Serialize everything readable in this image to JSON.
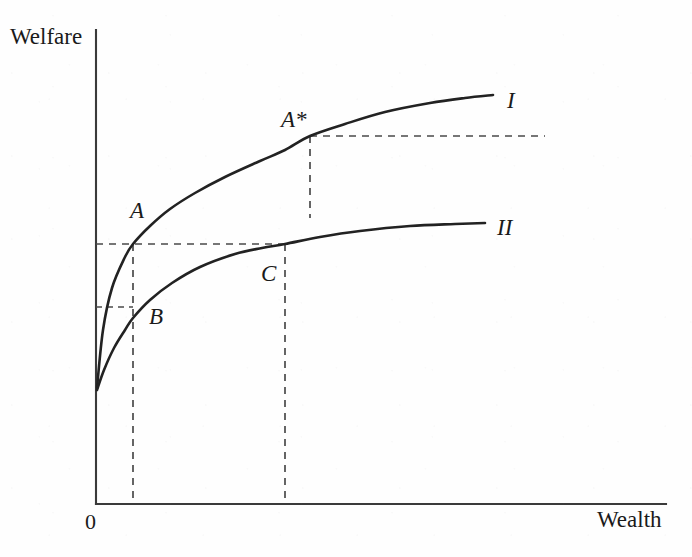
{
  "chart_data": {
    "type": "line",
    "title": "",
    "xlabel": "Wealth",
    "ylabel": "Welfare",
    "grid": false,
    "legend": "inline-right-of-curve",
    "axis_origin_label": "0",
    "axes": {
      "x_axis_pixel_y": 504,
      "y_axis_pixel_x": 96,
      "x_range_shown": [
        0,
        1
      ],
      "y_range_shown": [
        0,
        1
      ]
    },
    "series": [
      {
        "name": "I",
        "label": "I",
        "label_point": {
          "x": 510,
          "y": 101
        },
        "style": "solid",
        "color": "#222222",
        "points": [
          {
            "x": 97,
            "y": 388
          },
          {
            "x": 103,
            "y": 330
          },
          {
            "x": 112,
            "y": 288
          },
          {
            "x": 125,
            "y": 257
          },
          {
            "x": 133,
            "y": 244
          },
          {
            "x": 150,
            "y": 226
          },
          {
            "x": 170,
            "y": 209
          },
          {
            "x": 195,
            "y": 193
          },
          {
            "x": 225,
            "y": 177
          },
          {
            "x": 260,
            "y": 161
          },
          {
            "x": 285,
            "y": 150
          },
          {
            "x": 310,
            "y": 136
          },
          {
            "x": 345,
            "y": 124
          },
          {
            "x": 385,
            "y": 112
          },
          {
            "x": 430,
            "y": 103
          },
          {
            "x": 465,
            "y": 98
          },
          {
            "x": 493,
            "y": 95
          }
        ]
      },
      {
        "name": "II",
        "label": "II",
        "label_point": {
          "x": 500,
          "y": 229
        },
        "style": "solid",
        "color": "#222222",
        "points": [
          {
            "x": 97,
            "y": 390
          },
          {
            "x": 104,
            "y": 370
          },
          {
            "x": 114,
            "y": 348
          },
          {
            "x": 125,
            "y": 330
          },
          {
            "x": 133,
            "y": 318
          },
          {
            "x": 150,
            "y": 300
          },
          {
            "x": 172,
            "y": 283
          },
          {
            "x": 200,
            "y": 267
          },
          {
            "x": 235,
            "y": 254
          },
          {
            "x": 262,
            "y": 248
          },
          {
            "x": 285,
            "y": 244
          },
          {
            "x": 320,
            "y": 237
          },
          {
            "x": 360,
            "y": 231
          },
          {
            "x": 410,
            "y": 226
          },
          {
            "x": 455,
            "y": 224
          },
          {
            "x": 485,
            "y": 223
          }
        ]
      }
    ],
    "annotations": [
      {
        "label": "A",
        "kind": "point-label",
        "on_series": "I",
        "point": {
          "x": 133,
          "y": 244
        },
        "label_position": {
          "x": 130,
          "y": 199
        },
        "guides": [
          {
            "type": "horizontal-dashed",
            "from": {
              "x": 96,
              "y": 244
            },
            "to": {
              "x": 285,
              "y": 244
            }
          },
          {
            "type": "vertical-dashed",
            "from": {
              "x": 133,
              "y": 244
            },
            "to": {
              "x": 133,
              "y": 504
            }
          }
        ]
      },
      {
        "label": "B",
        "kind": "point-label",
        "on_series": "II",
        "point": {
          "x": 133,
          "y": 318
        },
        "label_position": {
          "x": 149,
          "y": 305
        },
        "guides": [
          {
            "type": "horizontal-dashed",
            "from": {
              "x": 96,
              "y": 307
            },
            "to": {
              "x": 133,
              "y": 307
            }
          }
        ]
      },
      {
        "label": "C",
        "kind": "point-label",
        "on_series": "II",
        "point": {
          "x": 285,
          "y": 244
        },
        "label_position": {
          "x": 261,
          "y": 262
        },
        "guides": [
          {
            "type": "vertical-dashed",
            "from": {
              "x": 285,
              "y": 244
            },
            "to": {
              "x": 285,
              "y": 504
            }
          }
        ]
      },
      {
        "label": "A*",
        "kind": "point-label",
        "on_series": "I",
        "point": {
          "x": 310,
          "y": 136
        },
        "label_position": {
          "x": 281,
          "y": 112
        },
        "guides": [
          {
            "type": "horizontal-dashed",
            "from": {
              "x": 310,
              "y": 136
            },
            "to": {
              "x": 545,
              "y": 136
            }
          },
          {
            "type": "vertical-dashed",
            "from": {
              "x": 310,
              "y": 136
            },
            "to": {
              "x": 310,
              "y": 218
            }
          }
        ]
      }
    ],
    "colors": {
      "axis": "#3a3a3a",
      "curve": "#222222",
      "dashed_guide": "#4a4a4a",
      "text": "#1a1a1a",
      "background": "#fefefe"
    }
  },
  "labels": {
    "y_axis_title": "Welfare",
    "x_axis_title": "Wealth",
    "origin": "0",
    "point_a": "A",
    "point_b": "B",
    "point_c": "C",
    "point_a_star": "A*",
    "curve_one": "I",
    "curve_two": "II"
  }
}
